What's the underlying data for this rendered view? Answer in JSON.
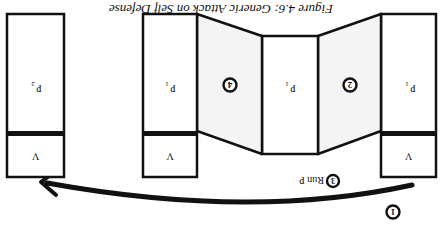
{
  "orientation": "rotated-180",
  "caption": "Figure 4.6: Generic Attack on Self Defense",
  "stacks": [
    {
      "id": "stack-right",
      "program_label": "P",
      "program_sub": "1",
      "return_label": "V"
    },
    {
      "id": "stack-mid",
      "program_label": "P",
      "program_sub": "1",
      "return_label": "V"
    },
    {
      "id": "stack-left",
      "program_label": "P",
      "program_sub": "2",
      "return_label": "V"
    }
  ],
  "middle_box": {
    "program_label": "P",
    "program_sub": "1"
  },
  "steps": [
    {
      "number": "1",
      "label": ""
    },
    {
      "number": "2",
      "label": ""
    },
    {
      "number": "3",
      "label": "Run P"
    },
    {
      "number": "4",
      "label": ""
    }
  ],
  "colors": {
    "stroke": "#111111",
    "background": "#ffffff",
    "panel_fill": "#f4f4f4"
  }
}
